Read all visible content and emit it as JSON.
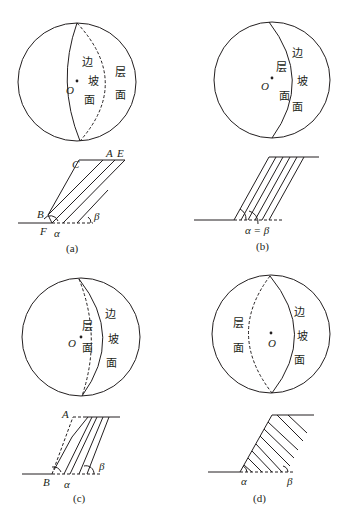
{
  "figure": {
    "panels": [
      {
        "id": "a",
        "caption": "(a)",
        "stereonet": {
          "center_label": "O",
          "slope_label": [
            "边",
            "坡",
            "面"
          ],
          "bedding_label": [
            "层",
            "面"
          ]
        },
        "section": {
          "points": [
            "C",
            "A",
            "E",
            "B",
            "F"
          ],
          "angles": [
            "α",
            "β"
          ]
        }
      },
      {
        "id": "b",
        "caption": "(b)",
        "stereonet": {
          "center_label": "O",
          "slope_label": [
            "边",
            "坡",
            "面"
          ],
          "bedding_label": [
            "层",
            "面"
          ]
        },
        "section": {
          "angle_text": "α = β"
        }
      },
      {
        "id": "c",
        "caption": "(c)",
        "stereonet": {
          "center_label": "O",
          "slope_label": [
            "边",
            "坡",
            "面"
          ],
          "bedding_label": [
            "层",
            "面"
          ]
        },
        "section": {
          "points": [
            "A",
            "B"
          ],
          "angles": [
            "α",
            "β"
          ]
        }
      },
      {
        "id": "d",
        "caption": "(d)",
        "stereonet": {
          "center_label": "O",
          "slope_label": [
            "边",
            "坡",
            "面"
          ],
          "bedding_label": [
            "层",
            "面"
          ]
        },
        "section": {
          "angles": [
            "α",
            "β"
          ]
        }
      }
    ]
  }
}
